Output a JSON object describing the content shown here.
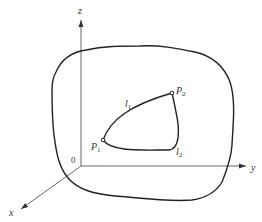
{
  "diagram": {
    "axes": {
      "x_label": "x",
      "y_label": "y",
      "z_label": "z",
      "origin_label": "0"
    },
    "points": {
      "p1_label": "P",
      "p1_sub": "1",
      "p2_label": "P",
      "p2_sub": "2"
    },
    "paths": {
      "l1_label": "l",
      "l1_sub": "1",
      "l2_label": "l",
      "l2_sub": "2"
    },
    "colors": {
      "stroke": "#222222",
      "axis": "#555555",
      "background": "#ffffff"
    }
  }
}
